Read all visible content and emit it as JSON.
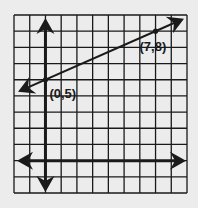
{
  "chart_data": {
    "type": "line",
    "title": "",
    "xlabel": "",
    "ylabel": "",
    "grid": true,
    "grid_cells": {
      "columns": 11,
      "rows": 11
    },
    "xlim": [
      -2,
      9
    ],
    "ylim": [
      -2,
      9
    ],
    "axes": {
      "x_axis_y": 0,
      "y_axis_x": 0,
      "arrows": true
    },
    "series": [
      {
        "name": "line",
        "points": [
          {
            "x": 0,
            "y": 5
          },
          {
            "x": 7,
            "y": 8
          }
        ],
        "extends_both_directions": true
      }
    ],
    "annotations": [
      {
        "text": "(0,5)",
        "x": 0,
        "y": 5
      },
      {
        "text": "(7,8)",
        "x": 7,
        "y": 8
      }
    ],
    "colors": {
      "background": "#ececec",
      "ink": "#1a1a1a"
    }
  }
}
